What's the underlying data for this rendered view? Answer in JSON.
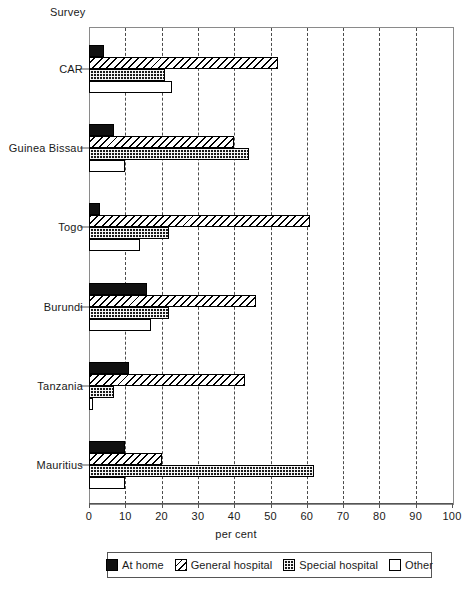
{
  "chart_data": {
    "type": "bar",
    "orientation": "horizontal",
    "title": "",
    "xlabel": "per cent",
    "ylabel": "Survey",
    "xlim": [
      0,
      100
    ],
    "xticks": [
      0,
      10,
      20,
      30,
      40,
      50,
      60,
      70,
      80,
      90,
      100
    ],
    "xtick_labels": [
      "0",
      "10",
      "20",
      "30",
      "40",
      "50",
      "60",
      "70",
      "80",
      "90",
      "100"
    ],
    "grid": "vertical-dashed",
    "legend_position": "bottom",
    "categories": [
      "CAR",
      "Guinea Bissau",
      "Togo",
      "Burundi",
      "Tanzania",
      "Mauritius"
    ],
    "series": [
      {
        "name": "At home",
        "pattern": "solid-black",
        "values": [
          4,
          7,
          3,
          16,
          11,
          10
        ]
      },
      {
        "name": "General hospital",
        "pattern": "diagonal-hatch",
        "values": [
          52,
          40,
          61,
          46,
          43,
          20
        ]
      },
      {
        "name": "Special hospital",
        "pattern": "dotted-dark",
        "values": [
          21,
          44,
          22,
          22,
          7,
          62
        ]
      },
      {
        "name": "Other",
        "pattern": "white-empty",
        "values": [
          23,
          10,
          14,
          17,
          1,
          10
        ]
      }
    ]
  },
  "legend": {
    "items": [
      {
        "label": "At home",
        "key": "athome"
      },
      {
        "label": "General hospital",
        "key": "general"
      },
      {
        "label": "Special hospital",
        "key": "special"
      },
      {
        "label": "Other",
        "key": "other"
      }
    ]
  }
}
